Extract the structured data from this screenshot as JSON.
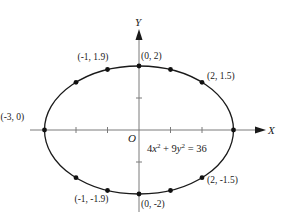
{
  "figure": {
    "equation": "4x² + 9y² = 36",
    "x_axis_label": "X",
    "y_axis_label": "Y",
    "origin_label": "O",
    "colors": {
      "curve": "#1a1a1a",
      "axis": "#7a7a7a",
      "text": "#1a1a1a",
      "background": "#ffffff"
    }
  },
  "chart_data": {
    "type": "scatter",
    "title": "",
    "equation": "4x^2 + 9y^2 = 36",
    "curve": {
      "shape": "ellipse",
      "center": [
        0,
        0
      ],
      "semi_major_x": 3,
      "semi_minor_y": 2
    },
    "xlabel": "X",
    "ylabel": "Y",
    "xlim": [
      -3.3,
      4.2
    ],
    "ylim": [
      -2.8,
      3.7
    ],
    "grid": false,
    "x_ticks": [
      -2,
      -1,
      1,
      2
    ],
    "y_ticks": [
      -1,
      1
    ],
    "points": [
      {
        "x": -3,
        "y": 0,
        "label": "(-3, 0)"
      },
      {
        "x": -2,
        "y": 1.49,
        "label": ""
      },
      {
        "x": -1,
        "y": 1.89,
        "label": "(-1, 1.9)"
      },
      {
        "x": 0,
        "y": 2,
        "label": "(0, 2)"
      },
      {
        "x": 1,
        "y": 1.89,
        "label": ""
      },
      {
        "x": 2,
        "y": 1.49,
        "label": "(2, 1.5)"
      },
      {
        "x": 3,
        "y": 0,
        "label": ""
      },
      {
        "x": 2,
        "y": -1.49,
        "label": "(2, -1.5)"
      },
      {
        "x": 1,
        "y": -1.89,
        "label": ""
      },
      {
        "x": 0,
        "y": -2,
        "label": "(0, -2)"
      },
      {
        "x": -1,
        "y": -1.89,
        "label": "(-1, -1.9)"
      },
      {
        "x": -2,
        "y": -1.49,
        "label": ""
      }
    ]
  }
}
